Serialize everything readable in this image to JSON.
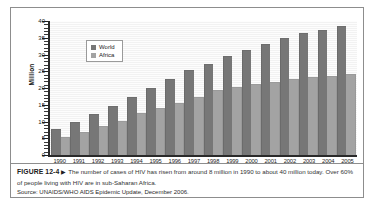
{
  "figure": {
    "number": "FIGURE 12-4",
    "arrow": "▶",
    "caption": "The number of cases of HIV has risen from around 8 million in 1990 to about 40 million today. Over 60% of people living with HIV are in sub-Saharan Africa.",
    "source": "Source: UNAIDS/WHO AIDS Epidemic Update, December 2006."
  },
  "colors": {
    "world": "#777777",
    "africa": "#a3a3a3",
    "plot_background": "#f2f2f2",
    "axis": "#2a2a2a",
    "border": "#8d8d8d"
  },
  "chart_data": {
    "type": "bar",
    "title": "",
    "subtitle": "",
    "xlabel": "",
    "ylabel": "Million",
    "ylim": [
      0,
      40
    ],
    "ytick_step": 5,
    "ytick_labels": [
      "40",
      "35",
      "30",
      "25",
      "20",
      "15",
      "10",
      "5",
      "0"
    ],
    "ytick_values": [
      40,
      35,
      30,
      25,
      20,
      15,
      10,
      5,
      0
    ],
    "grid": true,
    "grid_axis": "y",
    "legend": [
      "World",
      "Africa"
    ],
    "legend_position": "upper-left-inside",
    "categories": [
      "1990",
      "1991",
      "1992",
      "1993",
      "1994",
      "1995",
      "1996",
      "1997",
      "1998",
      "1999",
      "2000",
      "2001",
      "2002",
      "2003",
      "2004",
      "2005"
    ],
    "series": [
      {
        "name": "World",
        "color": "#777777",
        "values": [
          7.5,
          9.7,
          11.8,
          14.3,
          17.0,
          19.8,
          22.3,
          25.0,
          27.0,
          29.4,
          31.0,
          32.8,
          34.5,
          36.0,
          37.0,
          38.2
        ]
      },
      {
        "name": "Africa",
        "color": "#a3a3a3",
        "values": [
          5.2,
          6.6,
          8.3,
          9.9,
          12.1,
          13.7,
          15.3,
          17.1,
          19.0,
          20.0,
          20.8,
          21.5,
          22.3,
          23.1,
          23.4,
          24.0
        ]
      }
    ]
  }
}
